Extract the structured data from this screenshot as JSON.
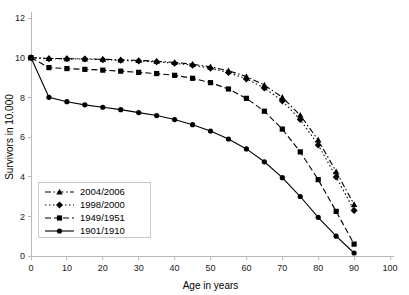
{
  "chart_data": {
    "type": "line",
    "title": "",
    "xlabel": "Age in years",
    "ylabel": "Survivors in 10.000",
    "xlim": [
      0,
      100
    ],
    "ylim": [
      0,
      12
    ],
    "xticks": [
      0,
      10,
      20,
      30,
      40,
      50,
      60,
      70,
      80,
      90,
      100
    ],
    "yticks": [
      0,
      2,
      4,
      6,
      8,
      10,
      12
    ],
    "xtick_labels": [
      "0",
      "10",
      "20",
      "30",
      "40",
      "50",
      "60",
      "70",
      "80",
      "90",
      "100"
    ],
    "ytick_labels": [
      "0",
      "2",
      "4",
      "6",
      "8",
      "10",
      "12"
    ],
    "grid": false,
    "legend_position": "lower-left",
    "x": [
      0,
      5,
      10,
      15,
      20,
      25,
      30,
      35,
      40,
      45,
      50,
      55,
      60,
      65,
      70,
      75,
      80,
      85,
      90
    ],
    "series": [
      {
        "name": "2004/2006",
        "marker": "triangle",
        "linestyle": "dash-dot",
        "values": [
          10.0,
          9.96,
          9.95,
          9.94,
          9.92,
          9.89,
          9.86,
          9.82,
          9.76,
          9.67,
          9.54,
          9.34,
          9.05,
          8.62,
          8.0,
          7.1,
          5.85,
          4.25,
          2.6
        ]
      },
      {
        "name": "1998/2000",
        "marker": "diamond",
        "linestyle": "dotted",
        "values": [
          10.0,
          9.95,
          9.94,
          9.93,
          9.9,
          9.87,
          9.83,
          9.79,
          9.72,
          9.62,
          9.47,
          9.25,
          8.93,
          8.47,
          7.82,
          6.88,
          5.6,
          3.98,
          2.3
        ]
      },
      {
        "name": "1949/1951",
        "marker": "square",
        "linestyle": "dashed",
        "values": [
          10.0,
          9.5,
          9.45,
          9.41,
          9.37,
          9.32,
          9.26,
          9.2,
          9.11,
          8.96,
          8.74,
          8.42,
          7.95,
          7.3,
          6.4,
          5.25,
          3.85,
          2.25,
          0.6
        ]
      },
      {
        "name": "1901/1910",
        "marker": "circle",
        "linestyle": "solid",
        "values": [
          10.0,
          8.0,
          7.78,
          7.62,
          7.5,
          7.38,
          7.23,
          7.08,
          6.88,
          6.62,
          6.3,
          5.9,
          5.4,
          4.75,
          3.95,
          3.0,
          1.95,
          1.0,
          0.15
        ]
      }
    ]
  },
  "legend": {
    "items": [
      {
        "label": "2004/2006"
      },
      {
        "label": "1998/2000"
      },
      {
        "label": "1949/1951"
      },
      {
        "label": "1901/1910"
      }
    ]
  }
}
